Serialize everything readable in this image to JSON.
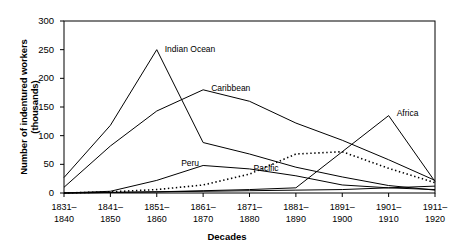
{
  "chart_data": {
    "type": "line",
    "title": "",
    "xlabel": "Decades",
    "ylabel": "Number of indentured workers (thousands)",
    "categories": [
      "1831–1840",
      "1841–1850",
      "1851–1860",
      "1861–1870",
      "1871–1880",
      "1881–1890",
      "1891–1900",
      "1901–1910",
      "1911–1920"
    ],
    "category_lines": [
      [
        "1831–",
        "1840"
      ],
      [
        "1841–",
        "1850"
      ],
      [
        "1851–",
        "1860"
      ],
      [
        "1861–",
        "1870"
      ],
      [
        "1871–",
        "1880"
      ],
      [
        "1881–",
        "1890"
      ],
      [
        "1891–",
        "1900"
      ],
      [
        "1901–",
        "1910"
      ],
      [
        "1911–",
        "1920"
      ]
    ],
    "ylim": [
      0,
      300
    ],
    "yticks": [
      0,
      50,
      100,
      150,
      200,
      250,
      300
    ],
    "ytick_labels": [
      "0",
      "50",
      "100",
      "150",
      "200",
      "250",
      "300"
    ],
    "grid": false,
    "legend_position": "inline-annotations",
    "series": [
      {
        "name": "Indian Ocean",
        "style": "solid",
        "color": "#000000",
        "values": [
          27,
          118,
          250,
          88,
          68,
          45,
          28,
          13,
          5
        ],
        "label_x": 2,
        "label_dx": 8,
        "label_dy": -6
      },
      {
        "name": "Caribbean",
        "style": "solid",
        "color": "#000000",
        "values": [
          10,
          82,
          143,
          180,
          160,
          122,
          92,
          58,
          22
        ],
        "label_x": 3,
        "label_dx": 8,
        "label_dy": -7
      },
      {
        "name": "Pacific",
        "style": "dotted",
        "color": "#000000",
        "values": [
          0,
          2,
          6,
          14,
          33,
          68,
          72,
          43,
          18
        ],
        "label_x": 4,
        "label_dx": 4,
        "label_dy": -11
      },
      {
        "name": "Peru",
        "style": "solid",
        "color": "#000000",
        "values": [
          0,
          3,
          22,
          48,
          42,
          30,
          14,
          9,
          6
        ],
        "label_x": 3,
        "label_dx": -22,
        "label_dy": -7
      },
      {
        "name": "Africa",
        "style": "solid",
        "color": "#000000",
        "values": [
          0,
          1,
          2,
          4,
          6,
          9,
          72,
          135,
          20
        ],
        "label_x": 7,
        "label_dx": 8,
        "label_dy": -8
      },
      {
        "name": "",
        "style": "solid",
        "color": "#000000",
        "values": [
          0,
          1,
          2,
          3,
          4,
          5,
          6,
          9,
          12
        ],
        "label_x": -1,
        "label_dx": 0,
        "label_dy": 0
      }
    ]
  }
}
